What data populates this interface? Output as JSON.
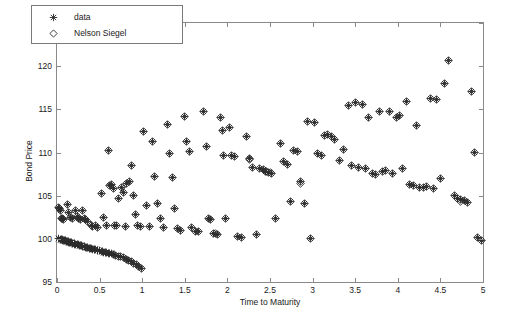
{
  "figure": {
    "background": "#ffffff",
    "axis_color": "#8a8a8a",
    "text_color": "#1a1a1a",
    "marker_color": "#2b2b2b"
  },
  "legend": {
    "position": "top-left",
    "entries": [
      {
        "label": "data",
        "marker": "star-marker"
      },
      {
        "label": "Nelson Siegel",
        "marker": "diamond-marker"
      }
    ]
  },
  "chart_data": {
    "type": "scatter",
    "title": "",
    "xlabel": "Time to Maturity",
    "ylabel": "Bond Price",
    "xlim": [
      0,
      5
    ],
    "ylim": [
      95,
      125
    ],
    "xticks": [
      0,
      0.5,
      1,
      1.5,
      2,
      2.5,
      3,
      3.5,
      4,
      4.5,
      5
    ],
    "xticklabels": [
      "0",
      "0.5",
      "1",
      "1.5",
      "2",
      "2.5",
      "3",
      "3.5",
      "4",
      "4.5",
      "5"
    ],
    "yticks": [
      95,
      100,
      105,
      110,
      115,
      120,
      125
    ],
    "yticklabels": [
      "95",
      "100",
      "105",
      "110",
      "115",
      "120",
      "125"
    ],
    "grid": false,
    "legend_position": "upper left",
    "series": [
      {
        "name": "data",
        "marker": "star",
        "color": "#2b2b2b",
        "points": [
          [
            0.02,
            100.0
          ],
          [
            0.04,
            99.95
          ],
          [
            0.05,
            99.9
          ],
          [
            0.06,
            99.88
          ],
          [
            0.07,
            99.85
          ],
          [
            0.08,
            99.82
          ],
          [
            0.09,
            99.8
          ],
          [
            0.1,
            99.76
          ],
          [
            0.11,
            99.72
          ],
          [
            0.12,
            99.7
          ],
          [
            0.13,
            99.66
          ],
          [
            0.14,
            99.62
          ],
          [
            0.15,
            99.6
          ],
          [
            0.16,
            99.56
          ],
          [
            0.17,
            99.52
          ],
          [
            0.18,
            99.5
          ],
          [
            0.2,
            99.45
          ],
          [
            0.21,
            99.4
          ],
          [
            0.22,
            99.38
          ],
          [
            0.24,
            99.33
          ],
          [
            0.25,
            99.3
          ],
          [
            0.26,
            99.26
          ],
          [
            0.28,
            99.2
          ],
          [
            0.29,
            99.17
          ],
          [
            0.3,
            99.14
          ],
          [
            0.32,
            99.1
          ],
          [
            0.33,
            99.05
          ],
          [
            0.35,
            99.0
          ],
          [
            0.36,
            98.97
          ],
          [
            0.38,
            98.92
          ],
          [
            0.39,
            98.88
          ],
          [
            0.41,
            98.84
          ],
          [
            0.42,
            98.8
          ],
          [
            0.44,
            98.75
          ],
          [
            0.45,
            98.72
          ],
          [
            0.47,
            98.68
          ],
          [
            0.48,
            98.64
          ],
          [
            0.5,
            98.6
          ],
          [
            0.52,
            98.55
          ],
          [
            0.53,
            98.5
          ],
          [
            0.55,
            98.46
          ],
          [
            0.57,
            98.42
          ],
          [
            0.58,
            98.38
          ],
          [
            0.6,
            98.33
          ],
          [
            0.62,
            98.3
          ],
          [
            0.64,
            98.25
          ],
          [
            0.66,
            98.2
          ],
          [
            0.69,
            98.1
          ],
          [
            0.72,
            98.0
          ],
          [
            0.75,
            97.9
          ],
          [
            0.78,
            97.8
          ],
          [
            0.81,
            97.65
          ],
          [
            0.84,
            97.5
          ],
          [
            0.87,
            97.35
          ],
          [
            0.9,
            97.2
          ],
          [
            0.93,
            97.0
          ],
          [
            0.96,
            96.8
          ],
          [
            0.99,
            96.6
          ],
          [
            0.02,
            103.6
          ],
          [
            0.03,
            103.5
          ],
          [
            0.04,
            103.3
          ],
          [
            0.05,
            102.4
          ],
          [
            0.06,
            102.3
          ],
          [
            0.08,
            102.2
          ],
          [
            0.12,
            104.0
          ],
          [
            0.14,
            103.1
          ],
          [
            0.16,
            102.5
          ],
          [
            0.18,
            102.3
          ],
          [
            0.22,
            103.3
          ],
          [
            0.24,
            102.6
          ],
          [
            0.25,
            102.4
          ],
          [
            0.27,
            102.2
          ],
          [
            0.3,
            103.3
          ],
          [
            0.32,
            102.4
          ],
          [
            0.34,
            102.2
          ],
          [
            0.36,
            102.0
          ],
          [
            0.4,
            101.6
          ],
          [
            0.42,
            101.4
          ],
          [
            0.45,
            101.5
          ],
          [
            0.48,
            101.3
          ],
          [
            0.52,
            105.2
          ],
          [
            0.55,
            102.5
          ],
          [
            0.58,
            101.6
          ],
          [
            0.62,
            106.2
          ],
          [
            0.64,
            106.3
          ],
          [
            0.66,
            105.8
          ],
          [
            0.68,
            101.6
          ],
          [
            0.7,
            101.5
          ],
          [
            0.72,
            104.7
          ],
          [
            0.76,
            106.0
          ],
          [
            0.78,
            105.4
          ],
          [
            0.8,
            101.4
          ],
          [
            0.82,
            106.4
          ],
          [
            0.85,
            106.6
          ],
          [
            0.88,
            108.5
          ],
          [
            0.9,
            105.0
          ],
          [
            0.92,
            102.8
          ],
          [
            0.95,
            101.5
          ],
          [
            0.98,
            101.4
          ],
          [
            0.6,
            110.2
          ],
          [
            1.02,
            112.4
          ],
          [
            1.05,
            103.9
          ],
          [
            1.08,
            101.4
          ],
          [
            1.12,
            111.3
          ],
          [
            1.15,
            107.2
          ],
          [
            1.18,
            104.1
          ],
          [
            1.22,
            102.3
          ],
          [
            1.25,
            101.3
          ],
          [
            1.3,
            113.2
          ],
          [
            1.32,
            109.9
          ],
          [
            1.35,
            107.1
          ],
          [
            1.38,
            103.5
          ],
          [
            1.42,
            101.2
          ],
          [
            1.45,
            101.0
          ],
          [
            1.5,
            114.2
          ],
          [
            1.52,
            111.3
          ],
          [
            1.55,
            110.1
          ],
          [
            1.58,
            101.3
          ],
          [
            1.62,
            100.9
          ],
          [
            1.66,
            100.8
          ],
          [
            1.72,
            114.8
          ],
          [
            1.75,
            110.7
          ],
          [
            1.78,
            102.3
          ],
          [
            1.8,
            102.2
          ],
          [
            1.84,
            100.6
          ],
          [
            1.88,
            100.5
          ],
          [
            1.92,
            114.0
          ],
          [
            1.94,
            112.5
          ],
          [
            1.96,
            109.6
          ],
          [
            1.98,
            102.4
          ],
          [
            2.02,
            112.9
          ],
          [
            2.05,
            109.6
          ],
          [
            2.08,
            109.5
          ],
          [
            2.12,
            100.3
          ],
          [
            2.16,
            100.2
          ],
          [
            2.22,
            111.9
          ],
          [
            2.26,
            109.3
          ],
          [
            2.3,
            108.3
          ],
          [
            2.34,
            100.5
          ],
          [
            2.38,
            108.2
          ],
          [
            2.42,
            108.0
          ],
          [
            2.45,
            107.8
          ],
          [
            2.48,
            107.7
          ],
          [
            2.52,
            107.6
          ],
          [
            2.56,
            102.3
          ],
          [
            2.62,
            111.1
          ],
          [
            2.66,
            109.0
          ],
          [
            2.7,
            108.6
          ],
          [
            2.74,
            104.3
          ],
          [
            2.78,
            110.2
          ],
          [
            2.82,
            110.1
          ],
          [
            2.86,
            106.6
          ],
          [
            2.9,
            104.1
          ],
          [
            2.94,
            113.6
          ],
          [
            2.98,
            100.0
          ],
          [
            3.02,
            113.5
          ],
          [
            3.06,
            109.9
          ],
          [
            3.1,
            109.7
          ],
          [
            3.14,
            112.0
          ],
          [
            3.18,
            112.1
          ],
          [
            3.22,
            111.9
          ],
          [
            3.26,
            111.5
          ],
          [
            3.32,
            109.1
          ],
          [
            3.36,
            110.4
          ],
          [
            3.42,
            115.4
          ],
          [
            3.46,
            108.5
          ],
          [
            3.5,
            115.8
          ],
          [
            3.54,
            108.3
          ],
          [
            3.58,
            115.6
          ],
          [
            3.62,
            108.2
          ],
          [
            3.66,
            114.0
          ],
          [
            3.7,
            107.6
          ],
          [
            3.74,
            107.5
          ],
          [
            3.78,
            114.8
          ],
          [
            3.82,
            107.8
          ],
          [
            3.86,
            107.9
          ],
          [
            3.9,
            114.7
          ],
          [
            3.94,
            107.6
          ],
          [
            3.98,
            114.1
          ],
          [
            4.02,
            114.3
          ],
          [
            4.06,
            108.2
          ],
          [
            4.1,
            115.9
          ],
          [
            4.14,
            106.3
          ],
          [
            4.18,
            106.2
          ],
          [
            4.22,
            113.1
          ],
          [
            4.26,
            106.0
          ],
          [
            4.3,
            105.9
          ],
          [
            4.34,
            106.1
          ],
          [
            4.38,
            116.2
          ],
          [
            4.42,
            105.8
          ],
          [
            4.46,
            116.1
          ],
          [
            4.5,
            107.0
          ],
          [
            4.55,
            118.0
          ],
          [
            4.6,
            120.6
          ],
          [
            4.66,
            105.0
          ],
          [
            4.7,
            104.7
          ],
          [
            4.74,
            104.6
          ],
          [
            4.78,
            104.4
          ],
          [
            4.82,
            104.2
          ],
          [
            4.86,
            117.1
          ],
          [
            4.9,
            110.0
          ],
          [
            4.94,
            100.2
          ],
          [
            4.98,
            99.8
          ]
        ]
      },
      {
        "name": "Nelson Siegel",
        "marker": "diamond",
        "color": "#2b2b2b",
        "note": "fitted values overlay the data markers; visible as hollow diamonds where the fit deviates",
        "deviating_points": [
          [
            2.5,
            107.7
          ],
          [
            2.46,
            107.8
          ],
          [
            2.86,
            106.4
          ],
          [
            4.74,
            104.3
          ],
          [
            1.86,
            100.6
          ],
          [
            2.26,
            109.2
          ]
        ]
      }
    ]
  }
}
